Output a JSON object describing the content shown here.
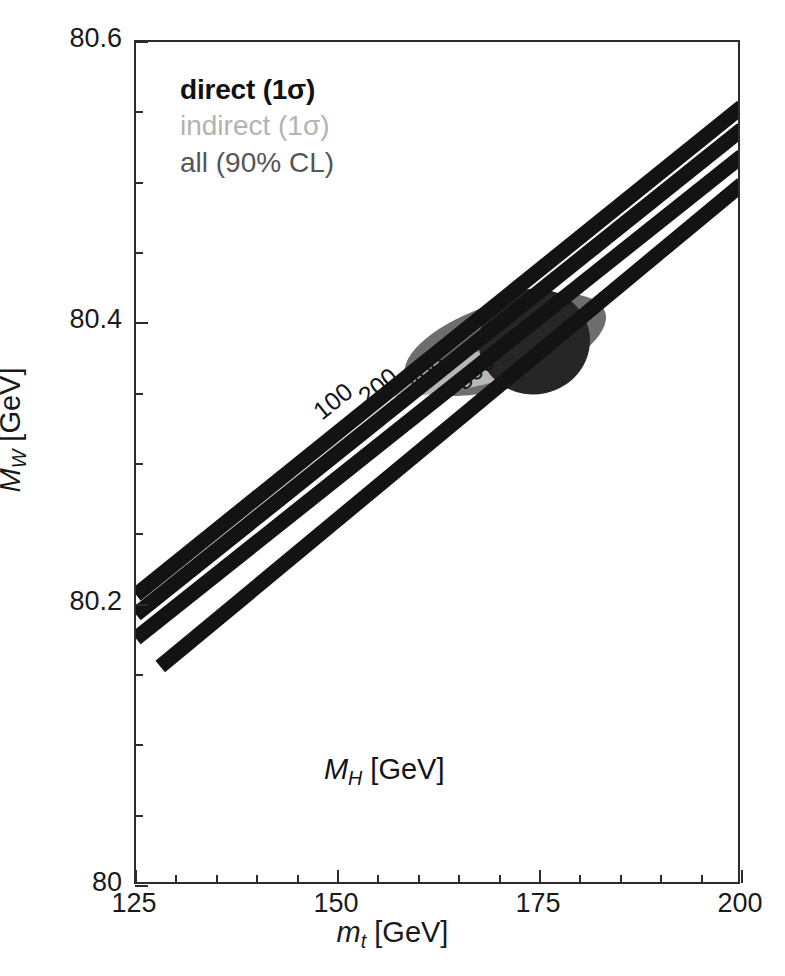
{
  "figure": {
    "background": "#ffffff",
    "frame_color": "#2b2b2b"
  },
  "axes": {
    "x": {
      "title_main": "m",
      "title_sub": "t",
      "title_unit": " [GeV]",
      "min": 125,
      "max": 200,
      "major_ticks": [
        125,
        150,
        175,
        200
      ],
      "major_labels": [
        "125",
        "150",
        "175",
        "200"
      ],
      "minor_step": 5
    },
    "y": {
      "title_main": "M",
      "title_sub": "W",
      "title_unit": " [GeV]",
      "min": 80.0,
      "max": 80.6,
      "major_ticks": [
        80.0,
        80.2,
        80.4,
        80.6
      ],
      "major_labels": [
        "80",
        "80.2",
        "80.4",
        "80.6"
      ],
      "minor_step": 0.05
    }
  },
  "legend": {
    "items": [
      {
        "label": "direct (1σ)",
        "color": "#111111",
        "name": "direct"
      },
      {
        "label": "indirect (1σ)",
        "color": "#b3b3b3",
        "name": "indirect"
      },
      {
        "label": "all  (90% CL)",
        "color": "#555555",
        "name": "all"
      }
    ]
  },
  "annotations": {
    "mh_main": "M",
    "mh_sub": "H",
    "mh_unit": " [GeV]",
    "contour_labels": [
      "100",
      "200",
      "400",
      "800"
    ]
  },
  "chart_data": {
    "type": "scatter",
    "title": "",
    "xlabel": "m_t [GeV]",
    "ylabel": "M_W [GeV]",
    "xlim": [
      125,
      200
    ],
    "ylim": [
      80.0,
      80.6
    ],
    "grid": false,
    "legend_position": "top-left",
    "tick_labels": {
      "x": [
        "125",
        "150",
        "175",
        "200"
      ],
      "y": [
        "80",
        "80.2",
        "80.4",
        "80.6"
      ]
    },
    "contours": {
      "description": "Standard Model prediction bands for fixed Higgs-boson mass M_H, drawn as thick black lines rising with m_t",
      "variable": "M_H [GeV]",
      "labels": [
        "100",
        "200",
        "400",
        "800"
      ],
      "lines": [
        {
          "label": "100",
          "points": [
            [
              125,
              80.207
            ],
            [
              200,
              80.554
            ]
          ]
        },
        {
          "label": "200",
          "points": [
            [
              125,
              80.193
            ],
            [
              200,
              80.538
            ]
          ]
        },
        {
          "label": "400",
          "points": [
            [
              125,
              80.176
            ],
            [
              200,
              80.519
            ]
          ]
        },
        {
          "label": "800",
          "points": [
            [
              128,
              80.156
            ],
            [
              200,
              80.499
            ]
          ]
        }
      ]
    },
    "ellipses": [
      {
        "name": "all",
        "label": "all  (90% CL)",
        "color": "#6e6e6e",
        "center": [
          170.7,
          80.385
        ],
        "semi_major_gev_x": 13.0,
        "semi_minor_gev_y": 0.03,
        "angle_deg": -18
      },
      {
        "name": "indirect",
        "label": "indirect (1σ)",
        "color": "#b8b8b8",
        "center": [
          167.5,
          80.368
        ],
        "semi_major_gev_x": 12.5,
        "semi_minor_gev_y": 0.012,
        "angle_deg": -13
      },
      {
        "name": "direct",
        "label": "direct (1σ)",
        "color": "#262626",
        "center": [
          174.3,
          80.387
        ],
        "semi_major_gev_x": 6.9,
        "semi_minor_gev_y": 0.0375,
        "angle_deg": -12
      }
    ]
  }
}
